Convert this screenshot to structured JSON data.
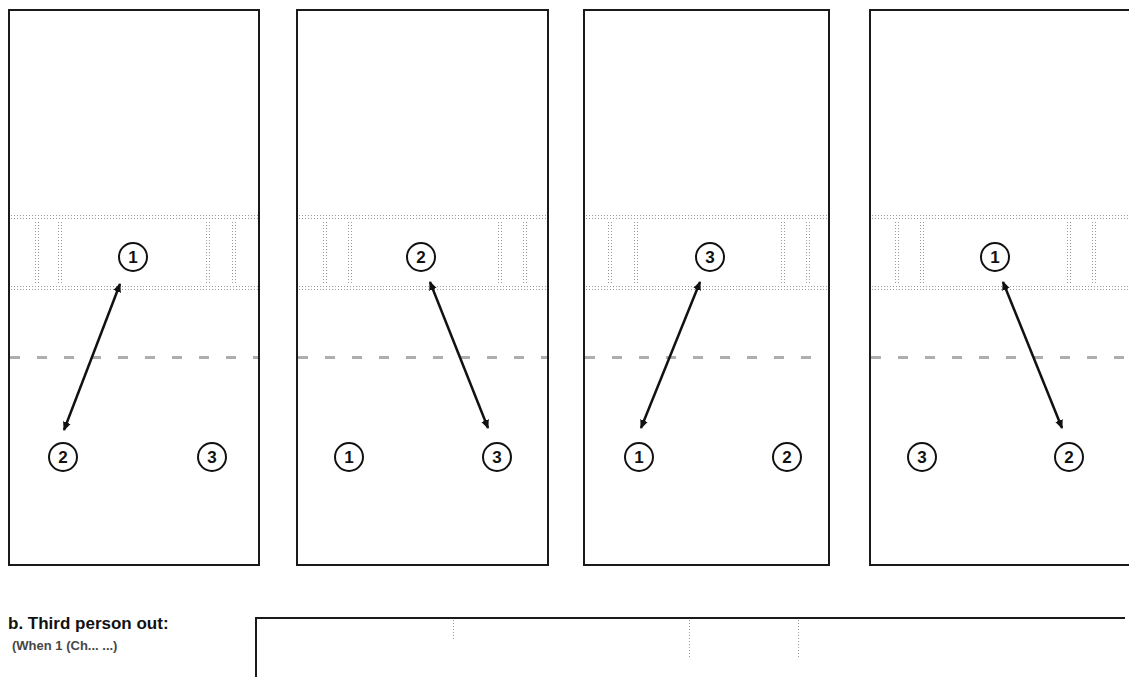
{
  "figure": {
    "panels": [
      {
        "id": 1,
        "net_player": "1",
        "back_left": "2",
        "back_right": "3",
        "arrow": {
          "from": "1",
          "to": "2"
        }
      },
      {
        "id": 2,
        "net_player": "2",
        "back_left": "1",
        "back_right": "3",
        "arrow": {
          "from": "2",
          "to": "3"
        }
      },
      {
        "id": 3,
        "net_player": "3",
        "back_left": "1",
        "back_right": "2",
        "arrow": {
          "from": "3",
          "to": "1"
        }
      },
      {
        "id": 4,
        "net_player": "1",
        "back_left": "3",
        "back_right": "2",
        "arrow": {
          "from": "1",
          "to": "2"
        }
      }
    ],
    "section_b": {
      "label": "b.  Third person out:",
      "sub_label_partial": "(When  1  (Ch...  ...)"
    }
  },
  "colors": {
    "ink": "#111111",
    "stipple": "#9a9a9a",
    "background": "#ffffff"
  }
}
